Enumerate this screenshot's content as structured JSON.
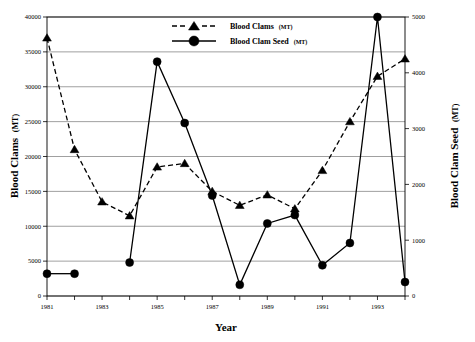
{
  "chart_data": {
    "type": "line",
    "title": "",
    "xlabel": "Year",
    "ylabel": "Blood Clams (MT)",
    "y2label": "Blood Clam Seed (MT)",
    "grid": true,
    "legend_position": "top-center",
    "x": [
      1981,
      1982,
      1983,
      1984,
      1985,
      1986,
      1987,
      1988,
      1989,
      1990,
      1991,
      1992,
      1993,
      1994
    ],
    "xtick_labels": [
      "1981",
      "1983",
      "1985",
      "1987",
      "1989",
      "1991",
      "1993"
    ],
    "xtick_values": [
      1981,
      1983,
      1985,
      1987,
      1989,
      1991,
      1993
    ],
    "xlim": [
      1981,
      1994
    ],
    "ylim": [
      0,
      40000
    ],
    "ytick_labels": [
      "0",
      "5000",
      "10000",
      "15000",
      "20000",
      "25000",
      "30000",
      "35000",
      "40000"
    ],
    "ytick_values": [
      0,
      5000,
      10000,
      15000,
      20000,
      25000,
      30000,
      35000,
      40000
    ],
    "y2lim": [
      0,
      5000
    ],
    "y2tick_labels": [
      "0",
      "1000",
      "2000",
      "3000",
      "4000",
      "5000"
    ],
    "y2tick_values": [
      0,
      1000,
      2000,
      3000,
      4000,
      5000
    ],
    "series": [
      {
        "name": "Blood Clams",
        "unit": "(MT)",
        "axis": "left",
        "marker": "triangle",
        "linestyle": "dashed",
        "color": "#000000",
        "values": [
          37000,
          21000,
          13500,
          11500,
          18500,
          19000,
          15000,
          13000,
          14500,
          12500,
          18000,
          25000,
          31500,
          34000
        ]
      },
      {
        "name": "Blood Clam Seed",
        "unit": "(MT)",
        "axis": "right",
        "marker": "circle",
        "linestyle": "solid",
        "color": "#000000",
        "values": [
          400,
          400,
          null,
          600,
          4200,
          3100,
          1800,
          200,
          1300,
          1450,
          550,
          950,
          5000,
          250
        ]
      }
    ]
  },
  "legend": {
    "items": [
      {
        "label": "Blood Clams",
        "unit": "(MT)",
        "marker": "triangle",
        "linestyle": "dashed"
      },
      {
        "label": "Blood Clam Seed",
        "unit": "(MT)",
        "marker": "circle",
        "linestyle": "solid"
      }
    ]
  },
  "axes": {
    "x_title": "Year",
    "y_left_title": "Blood Clams",
    "y_left_unit": "(MT)",
    "y_right_title": "Blood Clam Seed",
    "y_right_unit": "(MT)"
  }
}
